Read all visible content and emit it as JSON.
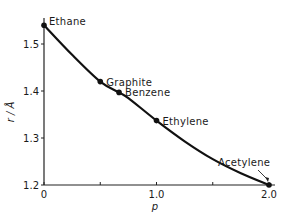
{
  "chart_data": {
    "type": "line",
    "title": "",
    "xlabel": "p",
    "ylabel": "r / Å",
    "xlim": [
      0,
      2.0
    ],
    "ylim": [
      1.2,
      1.55
    ],
    "x_ticks": [
      0,
      0.5,
      1.0,
      1.5,
      2.0
    ],
    "x_tick_labels": [
      "0",
      "",
      "1.0",
      "",
      "2.0"
    ],
    "y_ticks": [
      1.2,
      1.3,
      1.4,
      1.5
    ],
    "y_tick_labels": [
      "1.2",
      "1.3",
      "1.4",
      "1.5"
    ],
    "grid": false,
    "legend": "none",
    "curve": {
      "x": [
        0,
        0.25,
        0.5,
        0.667,
        0.75,
        1.0,
        1.25,
        1.5,
        1.75,
        2.0
      ],
      "y": [
        1.54,
        1.477,
        1.42,
        1.397,
        1.385,
        1.337,
        1.293,
        1.255,
        1.225,
        1.2
      ]
    },
    "points": [
      {
        "name": "Ethane",
        "x": 0,
        "y": 1.54
      },
      {
        "name": "Graphite",
        "x": 0.5,
        "y": 1.42
      },
      {
        "name": "Benzene",
        "x": 0.667,
        "y": 1.397
      },
      {
        "name": "Ethylene",
        "x": 1.0,
        "y": 1.337
      },
      {
        "name": "Acetylene",
        "x": 2.0,
        "y": 1.2
      }
    ],
    "annotations": [
      {
        "text": "Acetylene",
        "arrow_to": {
          "x": 2.0,
          "y": 1.2
        }
      }
    ]
  }
}
